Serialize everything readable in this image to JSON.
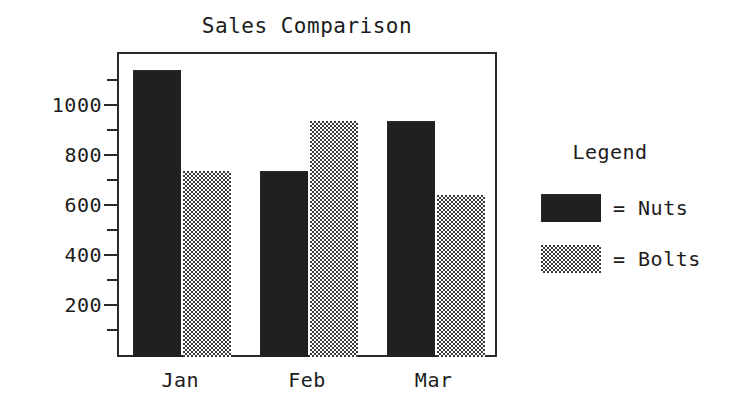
{
  "chart_data": {
    "type": "bar",
    "title": "Sales Comparison",
    "xlabel": "",
    "ylabel": "",
    "categories": [
      "Jan",
      "Feb",
      "Mar"
    ],
    "series": [
      {
        "name": "Nuts",
        "values": [
          1150,
          745,
          945
        ],
        "color": "#211f1f",
        "pattern": "solid-black"
      },
      {
        "name": "Bolts",
        "values": [
          745,
          945,
          650
        ],
        "color": "#3a3a3a",
        "pattern": "dotted-stipple"
      }
    ],
    "ylim": [
      0,
      1200
    ],
    "y_ticks_major": [
      200,
      400,
      600,
      800,
      1000
    ],
    "y_tick_labels": [
      "200",
      "400",
      "600",
      "800",
      "1000"
    ],
    "y_ticks_minor": [
      100,
      300,
      500,
      700,
      900,
      1100
    ],
    "grid": false,
    "legend": {
      "title": "Legend",
      "position": "right",
      "entries": [
        {
          "swatch": "nuts-swatch",
          "separator": "=",
          "label": "Nuts"
        },
        {
          "swatch": "bolts-swatch",
          "separator": "=",
          "label": "Bolts"
        }
      ]
    }
  },
  "legend": {
    "title": "Legend",
    "entries": [
      {
        "text": "= Nuts"
      },
      {
        "text": "= Bolts"
      }
    ]
  }
}
